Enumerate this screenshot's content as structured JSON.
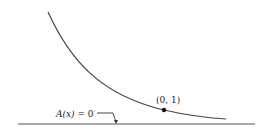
{
  "diagram": {
    "curve_label": "",
    "point_label": "(0, 1)",
    "asymptote_label": "A(x) = 0",
    "asymptote_label_parts": {
      "func": "A(x)",
      "eq": " = 0"
    },
    "colors": {
      "line": "#444444",
      "text": "#222222",
      "background": "#ffffff"
    }
  }
}
